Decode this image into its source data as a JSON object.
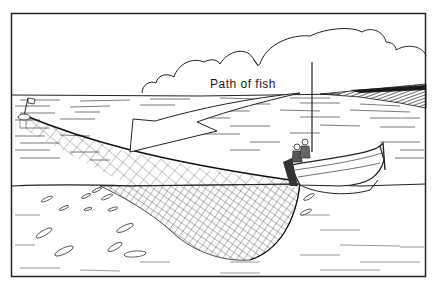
{
  "figure": {
    "label": "Path of fish",
    "colors": {
      "ink": "#1a1a1a",
      "paper": "#ffffff"
    }
  },
  "elements": {
    "arrow": "path-of-fish-arrow",
    "net": "seine-net",
    "boat": "fishing-boat",
    "float": "net-buoy-with-flag",
    "clouds": "cumulus-clouds",
    "fish_count": 14
  }
}
